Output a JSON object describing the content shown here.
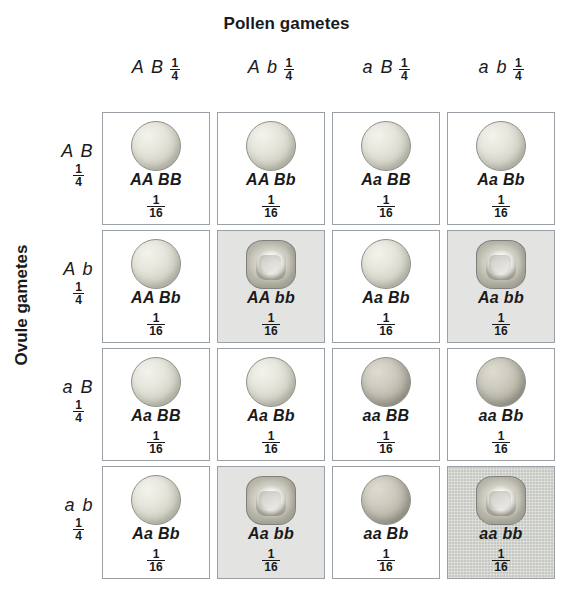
{
  "headings": {
    "pollen": "Pollen gametes",
    "ovule": "Ovule gametes"
  },
  "columns": [
    {
      "alleles": "A B",
      "fraction_num": "1",
      "fraction_den": "4"
    },
    {
      "alleles": "A b",
      "fraction_num": "1",
      "fraction_den": "4"
    },
    {
      "alleles": "a B",
      "fraction_num": "1",
      "fraction_den": "4"
    },
    {
      "alleles": "a b",
      "fraction_num": "1",
      "fraction_den": "4"
    }
  ],
  "rows": [
    {
      "alleles": "A B",
      "fraction_num": "1",
      "fraction_den": "4"
    },
    {
      "alleles": "A b",
      "fraction_num": "1",
      "fraction_den": "4"
    },
    {
      "alleles": "a B",
      "fraction_num": "1",
      "fraction_den": "4"
    },
    {
      "alleles": "a b",
      "fraction_num": "1",
      "fraction_den": "4"
    }
  ],
  "cells": [
    {
      "genotype": "AA BB",
      "fraction_num": "1",
      "fraction_den": "16",
      "seed": "round",
      "seed_shade": "light",
      "cell_shade": "white"
    },
    {
      "genotype": "AA Bb",
      "fraction_num": "1",
      "fraction_den": "16",
      "seed": "round",
      "seed_shade": "light",
      "cell_shade": "white"
    },
    {
      "genotype": "Aa BB",
      "fraction_num": "1",
      "fraction_den": "16",
      "seed": "round",
      "seed_shade": "light",
      "cell_shade": "white"
    },
    {
      "genotype": "Aa Bb",
      "fraction_num": "1",
      "fraction_den": "16",
      "seed": "round",
      "seed_shade": "light",
      "cell_shade": "white"
    },
    {
      "genotype": "AA Bb",
      "fraction_num": "1",
      "fraction_den": "16",
      "seed": "round",
      "seed_shade": "light",
      "cell_shade": "white"
    },
    {
      "genotype": "AA bb",
      "fraction_num": "1",
      "fraction_den": "16",
      "seed": "wrinkled",
      "seed_shade": "light",
      "cell_shade": "light"
    },
    {
      "genotype": "Aa Bb",
      "fraction_num": "1",
      "fraction_den": "16",
      "seed": "round",
      "seed_shade": "light",
      "cell_shade": "white"
    },
    {
      "genotype": "Aa bb",
      "fraction_num": "1",
      "fraction_den": "16",
      "seed": "wrinkled",
      "seed_shade": "light",
      "cell_shade": "light"
    },
    {
      "genotype": "Aa BB",
      "fraction_num": "1",
      "fraction_den": "16",
      "seed": "round",
      "seed_shade": "light",
      "cell_shade": "white"
    },
    {
      "genotype": "Aa Bb",
      "fraction_num": "1",
      "fraction_den": "16",
      "seed": "round",
      "seed_shade": "light",
      "cell_shade": "white"
    },
    {
      "genotype": "aa BB",
      "fraction_num": "1",
      "fraction_den": "16",
      "seed": "round",
      "seed_shade": "dark",
      "cell_shade": "white"
    },
    {
      "genotype": "aa Bb",
      "fraction_num": "1",
      "fraction_den": "16",
      "seed": "round",
      "seed_shade": "dark",
      "cell_shade": "white"
    },
    {
      "genotype": "Aa Bb",
      "fraction_num": "1",
      "fraction_den": "16",
      "seed": "round",
      "seed_shade": "light",
      "cell_shade": "white"
    },
    {
      "genotype": "Aa bb",
      "fraction_num": "1",
      "fraction_den": "16",
      "seed": "wrinkled",
      "seed_shade": "light",
      "cell_shade": "light"
    },
    {
      "genotype": "aa Bb",
      "fraction_num": "1",
      "fraction_den": "16",
      "seed": "round",
      "seed_shade": "dark",
      "cell_shade": "white"
    },
    {
      "genotype": "aa bb",
      "fraction_num": "1",
      "fraction_den": "16",
      "seed": "wrinkled",
      "seed_shade": "dark",
      "cell_shade": "dark"
    }
  ],
  "colors": {
    "cell_border": "#9aa0a6",
    "shade_light": "#e3e3e1",
    "shade_dark": "#c6c8c2",
    "text": "#1a1a1a"
  }
}
